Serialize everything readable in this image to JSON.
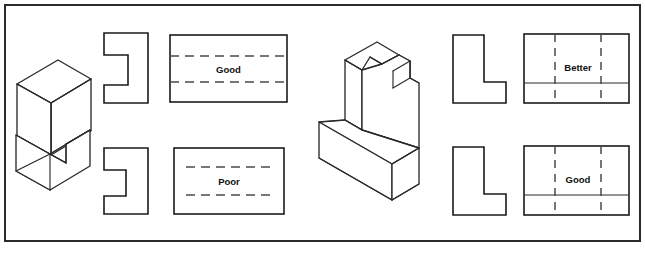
{
  "figure": {
    "border_color": "#2a2a2a",
    "line_color": "#1b1b1b",
    "hidden_line_color": "#4a4a4a",
    "background": "#ffffff"
  },
  "panels": [
    {
      "id": "left-panel",
      "pictorial": {
        "name": "c-channel-block",
        "description": "Isometric C-shaped channel block"
      },
      "rows": [
        {
          "id": "left-row-top",
          "side_view": {
            "name": "c-shape-profile-top",
            "notch": "shallow"
          },
          "front_view": {
            "label": "Good",
            "hidden_lines": "full-width-horizontal",
            "hidden_count": 2
          }
        },
        {
          "id": "left-row-bottom",
          "side_view": {
            "name": "c-shape-profile-bottom",
            "notch": "deep"
          },
          "front_view": {
            "label": "Poor",
            "hidden_lines": "inset-horizontal",
            "hidden_count": 2
          }
        }
      ]
    },
    {
      "id": "right-panel",
      "pictorial": {
        "name": "l-block-with-notch",
        "description": "Isometric L-shaped block with top notch"
      },
      "rows": [
        {
          "id": "right-row-top",
          "side_view": {
            "name": "l-shape-profile-top"
          },
          "front_view": {
            "label": "Better",
            "hidden_lines": "full-height-vertical",
            "hidden_count": 2,
            "solid_divider": true
          }
        },
        {
          "id": "right-row-bottom",
          "side_view": {
            "name": "l-shape-profile-bottom"
          },
          "front_view": {
            "label": "Good",
            "hidden_lines": "full-height-vertical",
            "hidden_count": 2,
            "solid_divider": true
          }
        }
      ]
    }
  ],
  "labels": {
    "good_top_left": "Good",
    "poor_bottom_left": "Poor",
    "better_top_right": "Better",
    "good_bottom_right": "Good"
  }
}
